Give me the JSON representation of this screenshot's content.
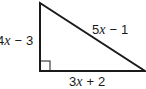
{
  "figure": {
    "type": "right-triangle",
    "stroke_color": "#1a1a1a",
    "background": "#ffffff",
    "vertices": {
      "top": [
        40,
        3
      ],
      "right_angle": [
        40,
        71
      ],
      "bottom_right": [
        145,
        71
      ]
    },
    "right_angle_marker": true,
    "sides": {
      "left": {
        "coef": "4",
        "var": "x",
        "op": "−",
        "const": "3",
        "label": "4x − 3"
      },
      "hypotenuse": {
        "coef": "5",
        "var": "x",
        "op": "−",
        "const": "1",
        "label": "5x − 1"
      },
      "bottom": {
        "coef": "3",
        "var": "x",
        "op": "+",
        "const": "2",
        "label": "3x + 2"
      }
    }
  }
}
